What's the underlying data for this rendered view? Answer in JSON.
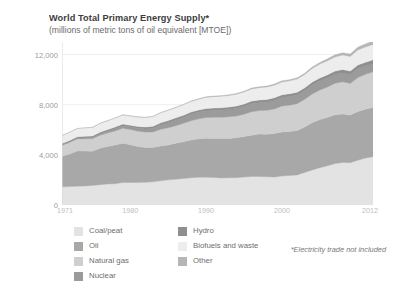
{
  "chart_data": {
    "type": "area",
    "title": "World Total Primary Energy Supply*",
    "subtitle": "(millions of metric tons of oil equivalent [MTOE])",
    "xlabel": "",
    "ylabel": "",
    "footnote": "*Electricity trade not included",
    "grid": true,
    "legend_position": "bottom-left",
    "stacked": true,
    "xlim": [
      1971,
      2012
    ],
    "ylim": [
      0,
      13000
    ],
    "yticks": [
      0,
      4000,
      8000,
      12000
    ],
    "ytick_labels": [
      "0",
      "4,000",
      "8,000",
      "12,000"
    ],
    "xticks": [
      1971,
      1980,
      1990,
      2000,
      2012
    ],
    "xtick_labels": [
      "1971",
      "1980",
      "1990",
      "2000",
      "2012"
    ],
    "x": [
      1971,
      1972,
      1973,
      1974,
      1975,
      1976,
      1977,
      1978,
      1979,
      1980,
      1981,
      1982,
      1983,
      1984,
      1985,
      1986,
      1987,
      1988,
      1989,
      1990,
      1991,
      1992,
      1993,
      1994,
      1995,
      1996,
      1997,
      1998,
      1999,
      2000,
      2001,
      2002,
      2003,
      2004,
      2005,
      2006,
      2007,
      2008,
      2009,
      2010,
      2011,
      2012
    ],
    "series": [
      {
        "name": "Coal/peat",
        "color": "#e3e3e3",
        "values": [
          1450,
          1470,
          1500,
          1520,
          1560,
          1620,
          1670,
          1700,
          1790,
          1800,
          1790,
          1810,
          1850,
          1930,
          2010,
          2050,
          2110,
          2170,
          2210,
          2220,
          2190,
          2160,
          2170,
          2180,
          2230,
          2270,
          2280,
          2250,
          2230,
          2310,
          2350,
          2400,
          2600,
          2800,
          2980,
          3130,
          3300,
          3380,
          3370,
          3570,
          3740,
          3850
        ]
      },
      {
        "name": "Oil",
        "color": "#a8a8a8",
        "values": [
          2430,
          2600,
          2800,
          2780,
          2730,
          2900,
          2990,
          3080,
          3140,
          3010,
          2880,
          2780,
          2730,
          2780,
          2780,
          2880,
          2930,
          3020,
          3070,
          3100,
          3110,
          3140,
          3130,
          3180,
          3230,
          3300,
          3380,
          3400,
          3470,
          3520,
          3520,
          3540,
          3620,
          3770,
          3830,
          3860,
          3900,
          3870,
          3800,
          3890,
          3900,
          3930
        ]
      },
      {
        "name": "Natural gas",
        "color": "#cfcfcf",
        "values": [
          890,
          930,
          970,
          990,
          990,
          1050,
          1080,
          1130,
          1200,
          1220,
          1220,
          1230,
          1250,
          1330,
          1370,
          1400,
          1470,
          1530,
          1590,
          1660,
          1690,
          1700,
          1730,
          1740,
          1780,
          1870,
          1870,
          1900,
          1960,
          2060,
          2090,
          2140,
          2210,
          2290,
          2360,
          2420,
          2510,
          2570,
          2530,
          2700,
          2780,
          2840
        ]
      },
      {
        "name": "Nuclear",
        "color": "#9b9b9b",
        "values": [
          29,
          40,
          54,
          74,
          103,
          117,
          149,
          171,
          177,
          186,
          222,
          244,
          281,
          343,
          403,
          439,
          465,
          503,
          518,
          526,
          552,
          560,
          578,
          587,
          608,
          629,
          622,
          636,
          663,
          676,
          687,
          692,
          687,
          713,
          722,
          728,
          709,
          712,
          698,
          719,
          674,
          642
        ]
      },
      {
        "name": "Hydro",
        "color": "#8f8f8f",
        "values": [
          104,
          109,
          110,
          119,
          123,
          124,
          130,
          139,
          146,
          148,
          151,
          156,
          165,
          172,
          176,
          181,
          183,
          188,
          189,
          184,
          191,
          193,
          200,
          203,
          212,
          217,
          221,
          224,
          227,
          225,
          224,
          225,
          226,
          238,
          246,
          255,
          264,
          276,
          281,
          295,
          296,
          313
        ]
      },
      {
        "name": "Biofuels and waste",
        "color": "#ededed",
        "values": [
          640,
          650,
          660,
          670,
          680,
          690,
          700,
          715,
          725,
          740,
          750,
          765,
          780,
          795,
          810,
          820,
          830,
          845,
          855,
          900,
          910,
          920,
          930,
          945,
          960,
          975,
          985,
          995,
          1010,
          1020,
          1030,
          1045,
          1060,
          1080,
          1100,
          1115,
          1130,
          1150,
          1165,
          1190,
          1205,
          1225
        ]
      },
      {
        "name": "Other",
        "color": "#b5b5b5",
        "values": [
          5,
          6,
          7,
          8,
          9,
          10,
          11,
          12,
          13,
          14,
          16,
          18,
          20,
          23,
          26,
          29,
          32,
          35,
          38,
          42,
          45,
          48,
          52,
          56,
          60,
          65,
          70,
          76,
          82,
          89,
          96,
          104,
          113,
          123,
          134,
          147,
          162,
          180,
          200,
          224,
          252,
          284
        ]
      }
    ]
  },
  "legend": {
    "left_column": [
      {
        "label": "Coal/peat",
        "color": "#e3e3e3"
      },
      {
        "label": "Oil",
        "color": "#a8a8a8"
      },
      {
        "label": "Natural gas",
        "color": "#cfcfcf"
      },
      {
        "label": "Nuclear",
        "color": "#9b9b9b"
      }
    ],
    "right_column": [
      {
        "label": "Hydro",
        "color": "#8f8f8f"
      },
      {
        "label": "Biofuels and waste",
        "color": "#ededed"
      },
      {
        "label": "Other",
        "color": "#b5b5b5"
      }
    ]
  },
  "colors": {
    "background": "#ffffff",
    "title": "#3d3d3d",
    "subtitle": "#6b6b6b",
    "axis_label": "#9a9a9a",
    "xtick_label": "#bdbdbd",
    "gridline": "#ebebeb",
    "axis_line": "#d8d8d8"
  }
}
